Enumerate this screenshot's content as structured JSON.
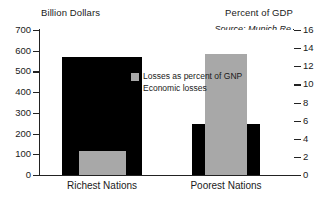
{
  "chart_data": {
    "type": "bar",
    "title": "",
    "categories": [
      "Richest Nations",
      "Poorest Nations"
    ],
    "series": [
      {
        "name": "Economic losses",
        "axis": "left",
        "unit": "Billion Dollars",
        "color": "#000000",
        "values": [
          570,
          245
        ]
      },
      {
        "name": "Losses as percent of GNP",
        "axis": "right",
        "unit": "Percent of GDP",
        "color": "#a8a8a8",
        "values": [
          2.6,
          13.3
        ]
      }
    ],
    "left_axis": {
      "label": "Billion Dollars",
      "ticks": [
        0,
        100,
        200,
        300,
        400,
        500,
        600,
        700
      ],
      "ylim": [
        0,
        700
      ]
    },
    "right_axis": {
      "label": "Percent of GDP",
      "ticks": [
        0,
        2,
        4,
        6,
        8,
        10,
        12,
        14,
        16
      ],
      "ylim": [
        0,
        16
      ]
    },
    "annotations": [
      "Source: Munich Re"
    ],
    "grid": false,
    "legend_position": "center"
  },
  "axes": {
    "left_title": "Billion Dollars",
    "right_title": "Percent of GDP",
    "left_ticks": [
      "700",
      "600",
      "500",
      "400",
      "300",
      "200",
      "100",
      "0"
    ],
    "right_ticks": [
      "16",
      "14",
      "12",
      "10",
      "8",
      "6",
      "4",
      "2",
      "0"
    ]
  },
  "source": {
    "text": "Source: Munich Re"
  },
  "legend": {
    "items": [
      {
        "label": "Losses as percent of GNP",
        "color": "#a8a8a8",
        "swatch": "gray-swatch"
      },
      {
        "label": "Economic losses",
        "color": "#000000",
        "swatch": "black-swatch"
      }
    ]
  },
  "categories": [
    {
      "label": "Richest Nations"
    },
    {
      "label": "Poorest Nations"
    }
  ]
}
